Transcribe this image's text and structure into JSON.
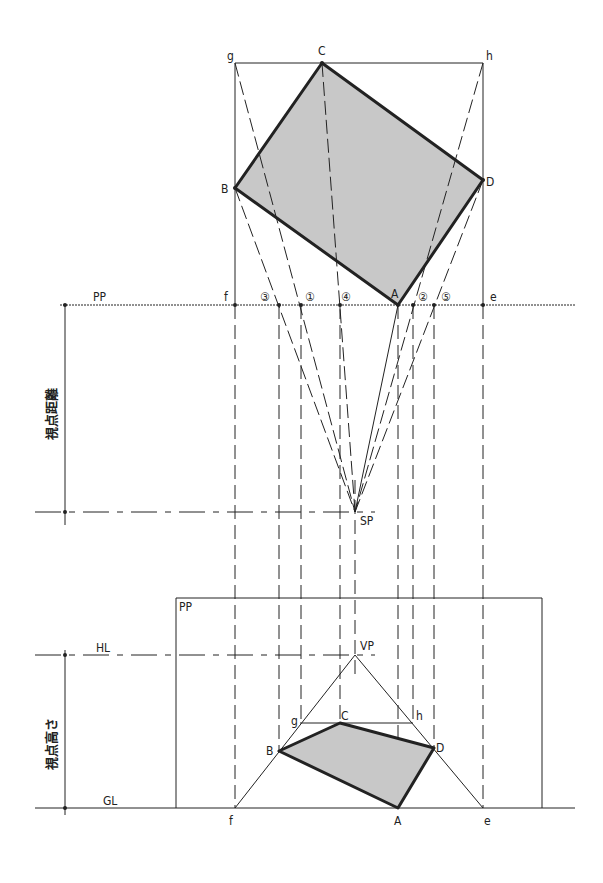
{
  "diagram": {
    "type": "two-point perspective construction (plan method)",
    "plan": {
      "labels": {
        "g": "g",
        "C": "C",
        "h": "h",
        "B": "B",
        "D": "D",
        "A": "A",
        "f": "f",
        "e": "e"
      },
      "picture_plane_label": "PP",
      "markers": [
        "③",
        "①",
        "④",
        "②",
        "⑤"
      ]
    },
    "station_point": "SP",
    "viewing_distance_label": "視点距離",
    "elevation": {
      "picture_plane_label": "PP",
      "horizon_label": "HL",
      "ground_label": "GL",
      "vanishing_point_label": "VP",
      "eye_height_label": "視点高さ",
      "labels": {
        "g": "g",
        "C": "C",
        "h": "h",
        "B": "B",
        "D": "D",
        "A": "A",
        "f": "f",
        "e": "e"
      }
    },
    "colors": {
      "line": "#222222",
      "fill": "#c8c8c8",
      "bg": "#ffffff"
    }
  }
}
